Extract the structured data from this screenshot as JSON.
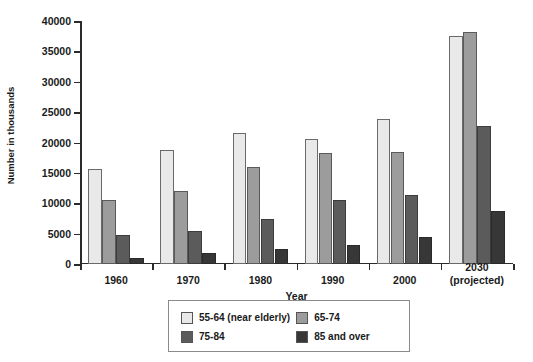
{
  "chart_data": {
    "type": "bar",
    "title": "",
    "xlabel": "Year",
    "ylabel": "Number in thousands",
    "ylim": [
      0,
      40000
    ],
    "ytick_labels": [
      "0",
      "5000",
      "10000",
      "15000",
      "20000",
      "25000",
      "30000",
      "35000",
      "40000"
    ],
    "ytick_values": [
      0,
      5000,
      10000,
      15000,
      20000,
      25000,
      30000,
      35000,
      40000
    ],
    "grid": false,
    "legend_position": "bottom-center",
    "categories": [
      "1960",
      "1970",
      "1980",
      "1990",
      "2000",
      "2030"
    ],
    "category_sublabels": [
      "",
      "",
      "",
      "",
      "",
      "(projected)"
    ],
    "series": [
      {
        "name": "55-64 (near elderly)",
        "color": "#e9e9e9",
        "values": [
          15600,
          18800,
          21500,
          20500,
          23900,
          37500
        ]
      },
      {
        "name": "65-74",
        "color": "#9c9c9c",
        "values": [
          10600,
          12000,
          15900,
          18300,
          18400,
          38200
        ]
      },
      {
        "name": "75-84",
        "color": "#5b5b5b",
        "values": [
          4700,
          5400,
          7400,
          10600,
          11400,
          22700
        ]
      },
      {
        "name": "85 and over",
        "color": "#373737",
        "values": [
          1000,
          1800,
          2400,
          3100,
          4400,
          8700
        ]
      }
    ]
  }
}
